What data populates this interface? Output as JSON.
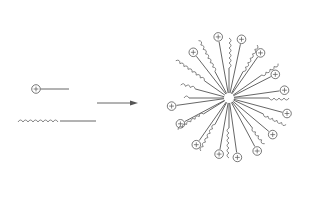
{
  "diagram": {
    "type": "micelle-formation",
    "legend": {
      "head_symbol": "+",
      "items": [
        {
          "name": "charged-head-molecule",
          "symbol": "+"
        },
        {
          "name": "hydrocarbon-tail-molecule"
        }
      ]
    },
    "arrow": {
      "direction": "right"
    },
    "micelle": {
      "center": [
        229,
        98
      ],
      "charged_heads_count": 14,
      "tail_chains_count": 10,
      "head_symbol": "+"
    },
    "colors": {
      "stroke": "#555555",
      "background": "#ffffff"
    }
  }
}
